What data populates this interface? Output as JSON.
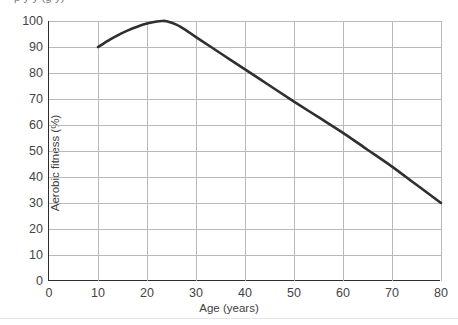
{
  "figure": {
    "cropped_title_fragment": "p y y (g y)",
    "background_color": "#ffffff",
    "curve_color": "#2f2f2f",
    "grid_color": "#b9b9b9",
    "axis_color": "#2d2d2d"
  },
  "chart_data": {
    "type": "line",
    "title": "",
    "xlabel": "Age (years)",
    "ylabel": "Aerobic fitness (%)",
    "xlim": [
      0,
      80
    ],
    "ylim": [
      0,
      100
    ],
    "xticks": [
      0,
      10,
      20,
      30,
      40,
      50,
      60,
      70,
      80
    ],
    "xtick_labels": [
      "0",
      "10",
      "20",
      "30",
      "40",
      "50",
      "60",
      "70",
      "80"
    ],
    "yticks": [
      0,
      10,
      20,
      30,
      40,
      50,
      60,
      70,
      80,
      90,
      100
    ],
    "ytick_labels": [
      "0",
      "10",
      "20",
      "30",
      "40",
      "50",
      "60",
      "70",
      "80",
      "90",
      "100"
    ],
    "grid": "both",
    "legend": "none",
    "series": [
      {
        "name": "Aerobic fitness vs age",
        "x": [
          10,
          12,
          14,
          16,
          18,
          20,
          22,
          23,
          24,
          26,
          28,
          30,
          35,
          40,
          45,
          50,
          55,
          60,
          65,
          70,
          75,
          80
        ],
        "y": [
          90,
          92.4,
          94.5,
          96.3,
          97.8,
          99,
          99.8,
          100,
          99.9,
          98.6,
          96.4,
          93.8,
          87.6,
          81.4,
          75.2,
          69,
          63,
          57,
          50.5,
          44,
          37,
          30
        ]
      }
    ],
    "annotations": {
      "start_point": "10 years, 90%",
      "peak_point": "about 23 years, 100%",
      "end_point": "80 years, 30%"
    }
  }
}
